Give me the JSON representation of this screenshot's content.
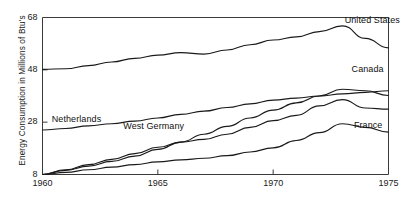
{
  "chart_data": {
    "type": "line",
    "title": "",
    "xlabel": "",
    "ylabel": "Energy Consumption in Millions of Btu's",
    "xlim": [
      1960,
      1975
    ],
    "ylim": [
      8,
      68
    ],
    "xticks": [
      1960,
      1965,
      1970,
      1975
    ],
    "yticks": [
      8,
      28,
      48,
      68
    ],
    "xtick_labels": [
      "1960",
      "1965",
      "1970",
      "1975"
    ],
    "ytick_labels": [
      "8",
      "28",
      "48",
      "68"
    ],
    "grid": false,
    "legend_position": "inline-annotations",
    "line_color": "#1a1a1a",
    "frame_color": "#3a3a3a",
    "x": [
      1960,
      1961,
      1962,
      1963,
      1964,
      1965,
      1966,
      1967,
      1968,
      1969,
      1970,
      1971,
      1972,
      1973,
      1974,
      1975
    ],
    "series": [
      {
        "name": "United States",
        "label": "United States",
        "values": [
          48.2,
          48.4,
          49.6,
          51.0,
          52.4,
          53.6,
          54.6,
          54.0,
          55.6,
          57.6,
          59.4,
          60.6,
          62.6,
          64.8,
          60.0,
          56.4
        ]
      },
      {
        "name": "Canada",
        "label": "Canada",
        "values": [
          25.0,
          25.6,
          26.6,
          27.4,
          28.4,
          29.6,
          31.0,
          32.2,
          33.6,
          35.0,
          36.4,
          37.2,
          38.0,
          38.8,
          39.4,
          40.0
        ]
      },
      {
        "name": "Netherlands",
        "label": "Netherlands",
        "values": [
          8.0,
          9.6,
          11.2,
          13.0,
          15.0,
          17.6,
          20.4,
          23.4,
          26.4,
          29.6,
          32.6,
          35.4,
          38.0,
          40.6,
          40.0,
          38.2
        ]
      },
      {
        "name": "West Germany",
        "label": "West Germany",
        "values": [
          8.0,
          9.8,
          11.8,
          13.8,
          16.0,
          18.4,
          20.4,
          21.4,
          23.4,
          26.0,
          28.6,
          30.6,
          34.2,
          36.6,
          33.4,
          33.0
        ]
      },
      {
        "name": "France",
        "label": "France",
        "values": [
          8.0,
          8.8,
          9.8,
          10.8,
          11.8,
          12.8,
          13.6,
          14.2,
          15.2,
          16.6,
          18.2,
          21.0,
          24.0,
          27.4,
          26.0,
          24.2
        ]
      }
    ],
    "annotations": [
      {
        "text": "United States",
        "x": 1973.1,
        "y": 66.5,
        "anchor": "start"
      },
      {
        "text": "Canada",
        "x": 1973.4,
        "y": 48.0,
        "anchor": "start"
      },
      {
        "text": "Netherlands",
        "x": 1960.4,
        "y": 28.8,
        "anchor": "start"
      },
      {
        "text": "West Germany",
        "x": 1963.5,
        "y": 26.0,
        "anchor": "start"
      },
      {
        "text": "France",
        "x": 1973.5,
        "y": 26.5,
        "anchor": "start"
      }
    ]
  }
}
